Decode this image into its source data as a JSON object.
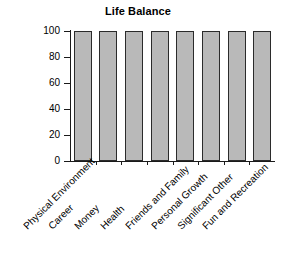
{
  "chart_data": {
    "type": "bar",
    "title": "Life Balance",
    "xlabel": "",
    "ylabel": "",
    "categories": [
      "Physical Environment",
      "Career",
      "Money",
      "Health",
      "Friends and Family",
      "Personal Growth",
      "Significant Other",
      "Fun and Recreation"
    ],
    "values": [
      100,
      100,
      100,
      100,
      100,
      100,
      100,
      100
    ],
    "ylim": [
      0,
      100
    ],
    "ytick_labels": [
      "100",
      "80",
      "60",
      "40",
      "20",
      "0"
    ],
    "ytick_values": [
      100,
      80,
      60,
      40,
      20,
      0
    ],
    "grid": false,
    "legend": false,
    "bar_fill_color": "#b9b9b9",
    "bar_edge_color": "#2b2b2b",
    "axis_color": "#1a1a1a",
    "background_color": "#ffffff",
    "label_rotation_degrees": 45
  }
}
